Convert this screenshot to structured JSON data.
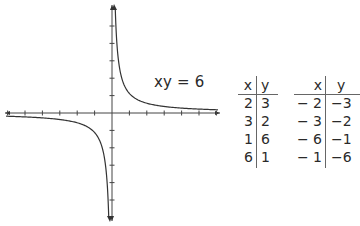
{
  "equation_label": "xy = 6",
  "graph": {
    "type": "hyperbola",
    "equation": "xy = 6",
    "x_ticks": [
      -6,
      -5,
      -4,
      -3,
      -2,
      -1,
      1,
      2,
      3,
      4,
      5,
      6
    ],
    "y_ticks": [
      -5,
      -4,
      -3,
      -2,
      -1,
      1,
      2,
      3,
      4,
      5
    ],
    "axis_arrows": true,
    "line_color": "#333333"
  },
  "tables": [
    {
      "headers": {
        "x": "x",
        "y": "y"
      },
      "rows": [
        {
          "x": "2",
          "y": "3"
        },
        {
          "x": "3",
          "y": "2"
        },
        {
          "x": "1",
          "y": "6"
        },
        {
          "x": "6",
          "y": "1"
        }
      ]
    },
    {
      "headers": {
        "x": "x",
        "y": "y"
      },
      "rows": [
        {
          "x": "− 2",
          "y": "−3"
        },
        {
          "x": "− 3",
          "y": "−2"
        },
        {
          "x": "− 6",
          "y": "−1"
        },
        {
          "x": "− 1",
          "y": "−6"
        }
      ]
    }
  ]
}
